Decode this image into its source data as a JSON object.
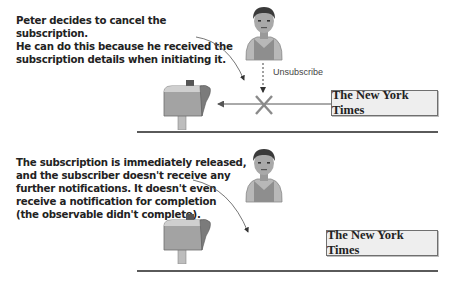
{
  "top_panel": {
    "caption": "Peter decides to cancel the subscription.\nHe can do this because he received the\nsubscription details when initiating it.",
    "action_label": "Unsubscribe",
    "publisher_label": "The New York Times",
    "icons": {
      "subscriber": "person-icon",
      "mailbox": "mailbox-icon",
      "cancel": "x-mark-icon"
    }
  },
  "bottom_panel": {
    "caption": "The subscription is immediately released,\nand the subscriber doesn't receive any\nfurther notifications. It doesn't even\nreceive a notification for completion\n(the observable didn't complete).",
    "publisher_label": "The New York Times",
    "icons": {
      "subscriber": "person-icon",
      "mailbox": "mailbox-icon"
    }
  },
  "colors": {
    "text": "#222222",
    "line": "#5a5a5a",
    "box_fill": "#eeeeee",
    "cancel_mark": "#8a8a8a"
  }
}
